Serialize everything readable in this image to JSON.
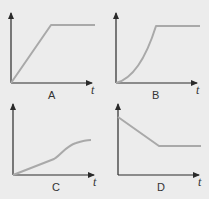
{
  "colors": {
    "background": "#ececec",
    "axis": "#2a2a2a",
    "curve": "#a9a9a9"
  },
  "graphs": [
    {
      "label": "A",
      "x_axis_label": "t",
      "description": "linear rise then constant"
    },
    {
      "label": "B",
      "x_axis_label": "t",
      "description": "accelerating curve rise then constant"
    },
    {
      "label": "C",
      "x_axis_label": "t",
      "description": "gradual linear rise then steeper curve leveling off"
    },
    {
      "label": "D",
      "x_axis_label": "t",
      "description": "linear decrease then constant"
    }
  ]
}
